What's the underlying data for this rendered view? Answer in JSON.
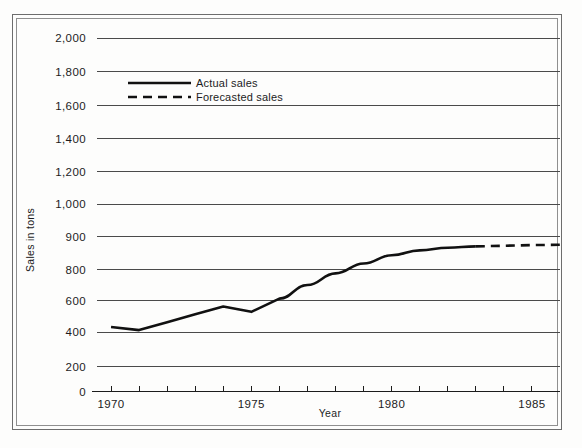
{
  "chart_data": {
    "type": "line",
    "title": "",
    "xlabel": "Year",
    "ylabel": "Sales in tons",
    "grid": true,
    "legend_position": "inside-top-center",
    "xlim": [
      1969.5,
      1986.0
    ],
    "x_tick_labels": [
      "1970",
      "1975",
      "1980",
      "1985"
    ],
    "x_tick_values": [
      1970,
      1975,
      1980,
      1985
    ],
    "x_minor_ticks": [
      1970,
      1971,
      1972,
      1973,
      1974,
      1975,
      1976,
      1977,
      1978,
      1979,
      1980,
      1981,
      1982,
      1983,
      1984,
      1985
    ],
    "y_tick_labels": [
      "0",
      "200",
      "400",
      "600",
      "800",
      "900",
      "1,000",
      "1,200",
      "1,400",
      "1,600",
      "1,800",
      "2,000"
    ],
    "y_tick_values": [
      0,
      200,
      400,
      600,
      800,
      900,
      1000,
      1200,
      1400,
      1600,
      1800,
      2000
    ],
    "y_axis_note": "non-linear: the 800-1,000 band is expanded relative to the rest of the scale",
    "ylim": [
      0,
      2000
    ],
    "series": [
      {
        "name": "Actual sales",
        "style": "solid",
        "color": "#111111",
        "x": [
          1970,
          1971,
          1972,
          1973,
          1974,
          1975,
          1976,
          1977,
          1978,
          1979,
          1980,
          1981,
          1982,
          1983
        ],
        "values": [
          432,
          412,
          462,
          512,
          562,
          528,
          612,
          700,
          775,
          818,
          843,
          858,
          866,
          870
        ]
      },
      {
        "name": "Forecasted sales",
        "style": "dashed",
        "color": "#111111",
        "x": [
          1983,
          1984,
          1985,
          1986
        ],
        "values": [
          870,
          872,
          874,
          875
        ]
      }
    ],
    "legend": [
      {
        "label": "Actual sales",
        "style": "solid"
      },
      {
        "label": "Forecasted sales",
        "style": "dashed"
      }
    ]
  }
}
